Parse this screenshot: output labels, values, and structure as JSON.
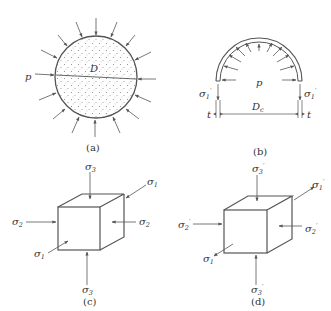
{
  "figures": [
    {
      "id": "a",
      "caption": "(a)",
      "labels": {
        "pressure": "p",
        "diameter": "D"
      }
    },
    {
      "id": "b",
      "caption": "(b)",
      "labels": {
        "pressure": "p",
        "stress_left": "σ",
        "stress_left_sub": "1",
        "stress_left_prime": "′",
        "stress_right": "σ",
        "stress_right_sub": "1",
        "stress_right_prime": "′",
        "thickness_left": "t",
        "thickness_right": "t",
        "diameter": "D",
        "diameter_sub": "c"
      }
    },
    {
      "id": "c",
      "caption": "(c)",
      "labels": {
        "top": "σ",
        "top_sub": "3",
        "bottom": "σ",
        "bottom_sub": "3",
        "left": "σ",
        "left_sub": "2",
        "right": "σ",
        "right_sub": "2",
        "upper_right": "σ",
        "upper_right_sub": "1",
        "lower_left": "σ",
        "lower_left_sub": "1"
      }
    },
    {
      "id": "d",
      "caption": "(d)",
      "labels": {
        "top": "σ",
        "top_sub": "3",
        "top_prime": "′",
        "bottom": "σ",
        "bottom_sub": "3",
        "bottom_prime": "′",
        "left": "σ",
        "left_sub": "2",
        "left_prime": "′",
        "right": "σ",
        "right_sub": "2",
        "right_prime": "′",
        "upper_right": "σ",
        "upper_right_sub": "1",
        "upper_right_prime": "′",
        "lower_left": "σ",
        "lower_left_sub": "1",
        "lower_left_prime": "′"
      }
    }
  ],
  "colors": {
    "stroke": "#555555",
    "text": "#333333",
    "fill_dots": "#777777"
  }
}
